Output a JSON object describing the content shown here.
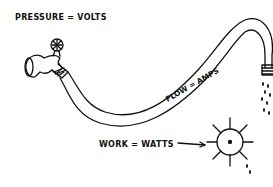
{
  "diagram": {
    "labels": {
      "pressure": "PRESSURE = VOLTS",
      "flow": "FLOW = AMPS",
      "work": "WORK = WATTS"
    },
    "elements": [
      {
        "name": "faucet",
        "represents": "pressure source"
      },
      {
        "name": "hose",
        "represents": "flow"
      },
      {
        "name": "water-drops",
        "represents": "flow output"
      },
      {
        "name": "water-wheel",
        "represents": "work"
      }
    ],
    "colors": {
      "ink": "#111111",
      "background": "#ffffff"
    }
  }
}
